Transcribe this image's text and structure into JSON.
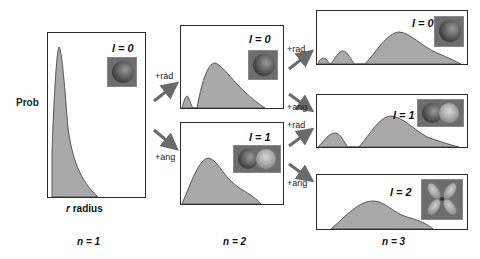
{
  "axis": {
    "y_label": "Prob",
    "x_label_var": "r",
    "x_label_text": "radius"
  },
  "columns": [
    {
      "label": "n = 1"
    },
    {
      "label": "n = 2"
    },
    {
      "label": "n = 3"
    }
  ],
  "boxes": {
    "n1_l0": {
      "l_label": "l = 0",
      "orbital": "s-orbital-sphere"
    },
    "n2_l0": {
      "l_label": "l = 0",
      "orbital": "s-orbital-sphere"
    },
    "n2_l1": {
      "l_label": "l = 1",
      "orbital": "p-orbital-dumbbell"
    },
    "n3_l0": {
      "l_label": "l = 0",
      "orbital": "s-orbital-sphere"
    },
    "n3_l1": {
      "l_label": "l = 1",
      "orbital": "p-orbital-dumbbell"
    },
    "n3_l2": {
      "l_label": "l = 2",
      "orbital": "d-orbital-cloverleaf"
    }
  },
  "arrows": [
    {
      "from": "n1_l0",
      "to": "n2_l0",
      "label": "+rad"
    },
    {
      "from": "n1_l0",
      "to": "n2_l1",
      "label": "+ang"
    },
    {
      "from": "n2_l0",
      "to": "n3_l0",
      "label": "+rad"
    },
    {
      "from": "n2_l0",
      "to": "n3_l1",
      "label": "+ang"
    },
    {
      "from": "n2_l1",
      "to": "n3_l1",
      "label": "+rad"
    },
    {
      "from": "n2_l1",
      "to": "n3_l2",
      "label": "+ang"
    }
  ],
  "colors": {
    "fill": "#a9a9a9",
    "stroke": "#555555",
    "arrow": "#6a6a6a",
    "border": "#2a2a2a",
    "orbital_bg": "#6d6d6d"
  }
}
